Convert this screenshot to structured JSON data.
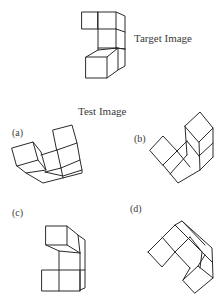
{
  "target": {
    "label": "Target Image"
  },
  "test": {
    "heading": "Test Image",
    "options": [
      {
        "label": "(a)"
      },
      {
        "label": "(b)"
      },
      {
        "label": "(c)"
      },
      {
        "label": "(d)"
      }
    ]
  },
  "colors": {
    "line": "#2a2a2a",
    "text": "#3a3a3a",
    "background": "#ffffff"
  }
}
